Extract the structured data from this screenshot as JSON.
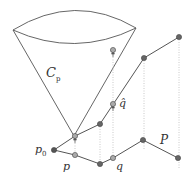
{
  "colors": {
    "line": "#555555",
    "dotted": "#bbbbbb",
    "dark_point": "#666666",
    "light_point": "#aaaaaa",
    "point_stroke": "#444444"
  },
  "labels": {
    "cone": "C",
    "cone_sub": "p",
    "p0": "p",
    "p0_sub": "0",
    "p": "p",
    "q": "q",
    "q_hat": "q̂",
    "P": "P"
  }
}
